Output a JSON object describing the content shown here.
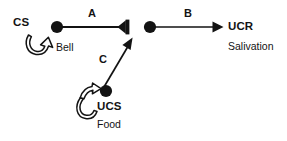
{
  "diagram": {
    "background_color": "#ffffff",
    "ink_color": "#131313",
    "nodes": [
      {
        "id": "cs",
        "term": "CS",
        "example": "Bell",
        "shape": "filled-circle",
        "x": 57,
        "y": 27
      },
      {
        "id": "ucr_source",
        "term": "",
        "example": "",
        "shape": "filled-circle",
        "x": 150,
        "y": 27
      },
      {
        "id": "ucs",
        "term": "UCS",
        "example": "Food",
        "shape": "filled-circle",
        "x": 106,
        "y": 91
      }
    ],
    "links": [
      {
        "id": "a",
        "label": "A",
        "from": "cs",
        "to": "junction",
        "arrowhead": "barbed-bar",
        "orientation": "horizontal"
      },
      {
        "id": "b",
        "label": "B",
        "from": "ucr_source",
        "to": "ucr",
        "arrowhead": "solid-triangle",
        "orientation": "horizontal"
      },
      {
        "id": "c",
        "label": "C",
        "from": "ucs",
        "to": "junction",
        "arrowhead": "solid-triangle",
        "orientation": "diagonal"
      }
    ],
    "outputs": [
      {
        "id": "ucr",
        "term": "UCR",
        "example": "Salivation"
      }
    ],
    "curved_arrows": [
      {
        "id": "cs-curved-arrow",
        "points_to": "Bell",
        "style": "hollow-outline-curved",
        "direction": "up-right"
      },
      {
        "id": "ucs-curved-arrow",
        "points_to": "UCS",
        "style": "hollow-outline-curved",
        "direction": "up-right"
      }
    ]
  },
  "labels": {
    "cs": "CS",
    "bell": "Bell",
    "a": "A",
    "b": "B",
    "c": "C",
    "ucr": "UCR",
    "salivation": "Salivation",
    "ucs": "UCS",
    "food": "Food"
  }
}
